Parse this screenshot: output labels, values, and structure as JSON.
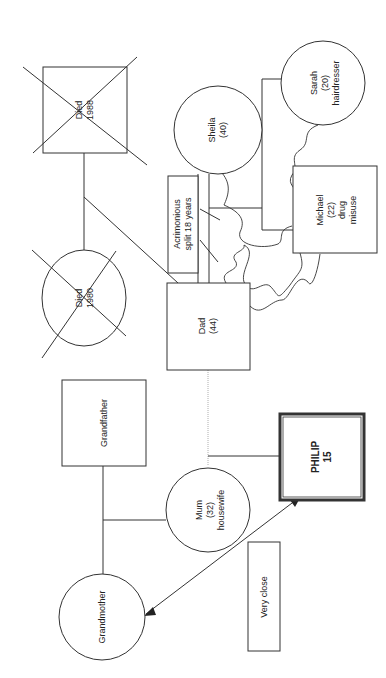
{
  "diagram": {
    "type": "genogram",
    "orientation": "rotated 90 degrees counter-clockwise",
    "colors": {
      "stroke": "#333333",
      "background": "#ffffff",
      "text": "#222222"
    },
    "people": {
      "died_1988": {
        "shape": "square",
        "deceased": true,
        "line1": "Died",
        "line2": "1988"
      },
      "died_1980": {
        "shape": "circle",
        "deceased": true,
        "line1": "Died",
        "line2": "1980"
      },
      "sheila": {
        "shape": "circle",
        "line1": "Sheila",
        "line2": "(40)"
      },
      "sarah": {
        "shape": "circle",
        "line1": "Sarah",
        "line2": "(20)",
        "line3": "hairdresser"
      },
      "michael": {
        "shape": "square",
        "line1": "Michael",
        "line2": "(22)",
        "line3": "drug",
        "line4": "misuse"
      },
      "dad": {
        "shape": "square",
        "line1": "Dad",
        "line2": "(44)"
      },
      "grandfather": {
        "shape": "square",
        "line1": "Grandfather"
      },
      "grandmother": {
        "shape": "circle",
        "line1": "Grandmother"
      },
      "mum": {
        "shape": "circle",
        "line1": "Mum",
        "line2": "(32)",
        "line3": "housewife"
      },
      "philip": {
        "shape": "double-square",
        "index_person": true,
        "line1": "PHILIP",
        "line2": "15"
      }
    },
    "annotations": {
      "acrimonious": {
        "line1": "Acrimonious",
        "line2": "split 18 years"
      },
      "very_close": {
        "line1": "Very close"
      }
    },
    "relationships": [
      {
        "from": "died_1988",
        "to": "died_1980",
        "type": "marriage"
      },
      {
        "from": "dad",
        "to": "sheila",
        "type": "divorced",
        "note": "Acrimonious split 18 years"
      },
      {
        "from": "dad",
        "to": "michael",
        "type": "conflict"
      },
      {
        "from": "sheila",
        "to": "michael",
        "type": "conflict"
      },
      {
        "from": "sarah",
        "to": "michael",
        "type": "conflict"
      },
      {
        "from": "dad",
        "to": "mum",
        "type": "unmarried"
      },
      {
        "from": "grandfather",
        "to": "grandmother",
        "type": "marriage"
      },
      {
        "from": "philip",
        "to": "grandmother",
        "type": "very close",
        "note": "Very close"
      }
    ]
  }
}
